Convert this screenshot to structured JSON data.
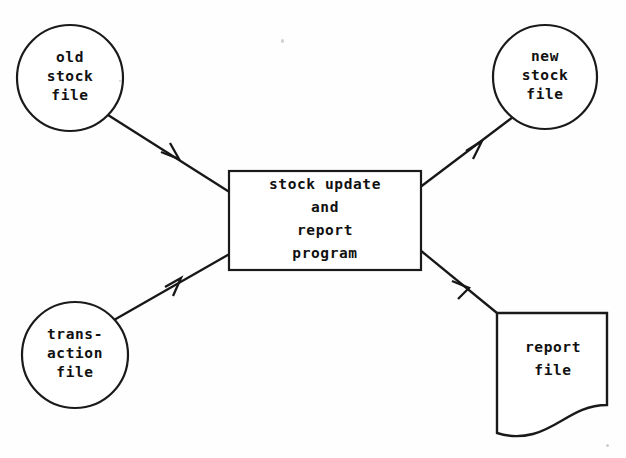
{
  "diagram": {
    "background_color": "#fefefe",
    "ink_color": "#171717",
    "nodes": {
      "old_stock_file": {
        "shape": "circle",
        "label": "old\nstock\nfile",
        "cx": 70,
        "cy": 78,
        "r": 53
      },
      "transaction_file": {
        "shape": "circle",
        "label": "trans-\naction\nfile",
        "cx": 75,
        "cy": 355,
        "r": 53
      },
      "process": {
        "shape": "rectangle",
        "label": "stock update\nand\nreport\nprogram",
        "x": 229,
        "y": 171,
        "width": 192,
        "height": 99
      },
      "new_stock_file": {
        "shape": "circle",
        "label": "new\nstock\nfile",
        "cx": 545,
        "cy": 77,
        "r": 52
      },
      "report_file": {
        "shape": "document",
        "label": "report\nfile",
        "x": 497,
        "y": 313,
        "width": 110,
        "height": 122
      }
    },
    "connectors": [
      {
        "name": "old-stock-to-process",
        "from": "old_stock_file",
        "to": "process",
        "direction": "down-right",
        "arrowhead_at": {
          "x": 176,
          "y": 156
        }
      },
      {
        "name": "transaction-to-process",
        "from": "transaction_file",
        "to": "process",
        "direction": "up-right",
        "arrowhead_at": {
          "x": 178,
          "y": 282
        }
      },
      {
        "name": "process-to-new-stock",
        "from": "process",
        "to": "new_stock_file",
        "direction": "up-right",
        "arrowhead_at": {
          "x": 478,
          "y": 145
        }
      },
      {
        "name": "process-to-report",
        "from": "process",
        "to": "report_file",
        "direction": "down-right",
        "arrowhead_at": {
          "x": 465,
          "y": 285
        }
      }
    ]
  }
}
